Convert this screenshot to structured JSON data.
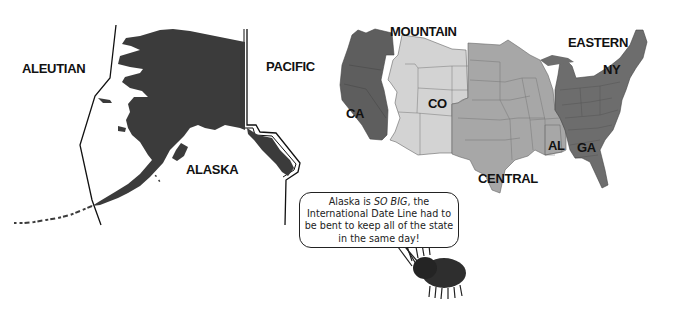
{
  "zones": {
    "aleutian": "ALEUTIAN",
    "pacific_ak": "PACIFIC",
    "mountain": "MOUNTAIN",
    "central": "CENTRAL",
    "eastern": "EASTERN"
  },
  "places": {
    "alaska": "ALASKA",
    "ca": "CA",
    "co": "CO",
    "al": "AL",
    "ga": "GA",
    "ny": "NY"
  },
  "speech_bubble": {
    "line1_a": "Alaska is ",
    "line1_em": "SO BIG",
    "line1_b": ", the",
    "line2": "International Date Line had to",
    "line3": "be bent to keep all of the state",
    "line4": "in the same day!"
  },
  "colors": {
    "alaska": "#3a3a3a",
    "pacific": "#5c5c5c",
    "mountain": "#d2d2d2",
    "central": "#a6a6a6",
    "eastern": "#6c6c6c",
    "border": "#444444"
  }
}
